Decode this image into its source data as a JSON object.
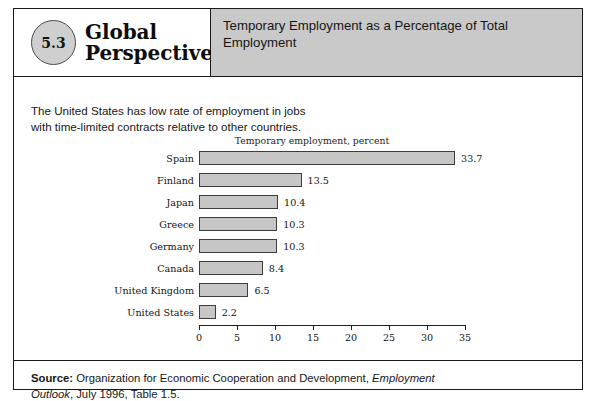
{
  "figure": {
    "badge_number": "5.3",
    "brand_line_1": "Global",
    "brand_line_2": "Perspective",
    "title": "Temporary Employment as a Percentage of Total Employment",
    "caption_line_1": "The United States has low rate of employment in jobs",
    "caption_line_2": "with time-limited contracts relative to other countries.",
    "source_prefix": "Source:",
    "source_text_1": " Organization for Economic Cooperation and Development, ",
    "source_italic": "Employment Outlook",
    "source_text_2": ", July 1996, Table 1.5."
  },
  "chart_data": {
    "type": "bar",
    "orientation": "horizontal",
    "title": "Temporary employment, percent",
    "xlabel": "Temporary employment, percent",
    "ylabel": "",
    "categories": [
      "Spain",
      "Finland",
      "Japan",
      "Greece",
      "Germany",
      "Canada",
      "United Kingdom",
      "United States"
    ],
    "values": [
      33.7,
      13.5,
      10.4,
      10.3,
      10.3,
      8.4,
      6.5,
      2.2
    ],
    "value_labels": [
      "33.7",
      "13.5",
      "10.4",
      "10.3",
      "10.3",
      "8.4",
      "6.5",
      "2.2"
    ],
    "xlim": [
      0,
      35
    ],
    "xticks": [
      0,
      5,
      10,
      15,
      20,
      25,
      30,
      35
    ],
    "xtick_labels": [
      "0",
      "5",
      "10",
      "15",
      "20",
      "25",
      "30",
      "35"
    ],
    "grid": false,
    "legend": false,
    "bar_fill_color": "#c6c6c6",
    "bar_border_color": "#3d3d3d"
  },
  "colors": {
    "header_band": "#c9c9c9",
    "badge_fill": "#cfcfcf",
    "frame": "#1a1a1a"
  }
}
